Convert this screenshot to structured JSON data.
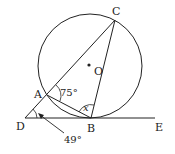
{
  "diagram": {
    "type": "geometry",
    "circle": {
      "center_label": "O",
      "cx": 90,
      "cy": 66,
      "r": 52
    },
    "points": {
      "A": {
        "label": "A",
        "x": 47,
        "y": 95
      },
      "B": {
        "label": "B",
        "x": 91,
        "y": 118
      },
      "C": {
        "label": "C",
        "x": 115,
        "y": 20
      },
      "D": {
        "label": "D",
        "x": 25,
        "y": 118
      },
      "E": {
        "label": "E",
        "x": 155,
        "y": 118
      },
      "O": {
        "label": "O",
        "x": 90,
        "y": 66
      }
    },
    "segments": [
      "D-C",
      "D-E",
      "A-B",
      "B-C"
    ],
    "angles": {
      "CAB": {
        "label": "75°"
      },
      "ABC": {
        "label": "x"
      },
      "ADB": {
        "label": "49°"
      }
    },
    "colors": {
      "stroke": "#222222",
      "background": "#ffffff"
    }
  }
}
